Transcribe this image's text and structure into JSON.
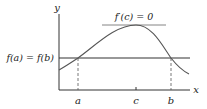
{
  "diagram": {
    "axes": {
      "x_label": "x",
      "y_label": "y"
    },
    "labels": {
      "horizontal_line": "f(a) = f(b)",
      "tangent": "f′(c) = 0",
      "tick_a": "a",
      "tick_c": "c",
      "tick_b": "b"
    },
    "colors": {
      "curve": "#555555",
      "axes": "#333333",
      "line": "#333333",
      "tangent": "#777777"
    }
  }
}
